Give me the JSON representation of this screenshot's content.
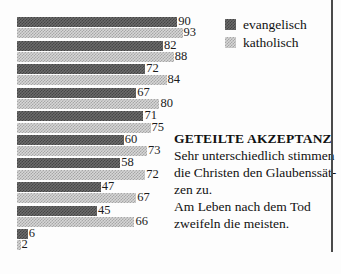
{
  "chart_data": {
    "type": "bar",
    "orientation": "horizontal",
    "title": "",
    "value_range": [
      0,
      100
    ],
    "value_labels": true,
    "grid": false,
    "legend_position": "top-right",
    "series": [
      {
        "name": "evangelisch",
        "color": "#5a5a5a",
        "pattern": "dark-checker-halftone",
        "values": [
          90,
          82,
          72,
          67,
          71,
          60,
          58,
          47,
          45,
          6
        ]
      },
      {
        "name": "katholisch",
        "color": "#c0c0c0",
        "pattern": "light-checker-halftone",
        "values": [
          93,
          88,
          84,
          80,
          75,
          73,
          72,
          67,
          66,
          2
        ]
      }
    ]
  },
  "annotation": {
    "title": "GETEILTE AKZEPTANZ",
    "lines": [
      "Sehr unterschiedlich stimmen",
      "die Christen den Glaubenssät-",
      "zen zu.",
      "Am Leben nach dem Tod",
      "zweifeln die meisten."
    ]
  },
  "colors": {
    "bar_dark": "#5a5a5a",
    "bar_light": "#c0c0c0",
    "text": "#111111",
    "rule": "#4a4a4a",
    "background": "#fdfdfd"
  }
}
